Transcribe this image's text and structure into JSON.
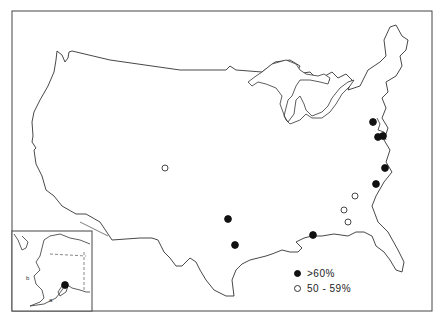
{
  "map": {
    "type": "thematic dot map",
    "region": "United States (with Alaska inset)",
    "colors": {
      "outline": "#333333",
      "filled_marker": "#111111",
      "open_marker_stroke": "#333333",
      "background": "#ffffff"
    }
  },
  "legend": {
    "items": [
      {
        "symbol": "filled-circle",
        "label": ">60%"
      },
      {
        "symbol": "open-circle",
        "label": "50 - 59%"
      }
    ]
  },
  "inset": {
    "region": "Alaska",
    "labels": {
      "a": "a",
      "b": "b"
    }
  },
  "markers": [
    {
      "category": ">60%",
      "x": 373,
      "y": 122
    },
    {
      "category": ">60%",
      "x": 378,
      "y": 137
    },
    {
      "category": ">60%",
      "x": 383,
      "y": 136
    },
    {
      "category": ">60%",
      "x": 385,
      "y": 168
    },
    {
      "category": ">60%",
      "x": 376,
      "y": 184
    },
    {
      "category": ">60%",
      "x": 228,
      "y": 219
    },
    {
      "category": ">60%",
      "x": 235,
      "y": 245
    },
    {
      "category": ">60%",
      "x": 313,
      "y": 235
    },
    {
      "category": ">60%",
      "x": 65,
      "y": 285
    },
    {
      "category": "50-59%",
      "x": 165,
      "y": 168
    },
    {
      "category": "50-59%",
      "x": 355,
      "y": 196
    },
    {
      "category": "50-59%",
      "x": 344,
      "y": 210
    },
    {
      "category": "50-59%",
      "x": 348,
      "y": 222
    }
  ]
}
